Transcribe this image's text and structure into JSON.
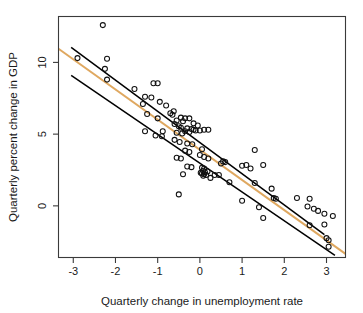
{
  "chart_data": {
    "type": "scatter",
    "title": "",
    "xlabel": "Quarterly change in unemployment rate",
    "ylabel": "Quarterly percent change in GDP",
    "xlim": [
      -3.35,
      3.45
    ],
    "ylim": [
      -3.6,
      13.2
    ],
    "xticks": [
      -3,
      -2,
      -1,
      0,
      1,
      2,
      3
    ],
    "xtick_labels": [
      "-3",
      "-2",
      "-1",
      "0",
      "1",
      "2",
      "3"
    ],
    "yticks": [
      0,
      5,
      10
    ],
    "ytick_labels": [
      "0",
      "5",
      "10"
    ],
    "grid": false,
    "legend": "none",
    "marker": "open-circle",
    "marker_color": "#111111",
    "fit_line": {
      "name": "regression line",
      "color": "#DFA860",
      "x": [
        -3.35,
        3.45
      ],
      "y": [
        10.95,
        -3.35
      ],
      "slope": -2.1,
      "intercept": 3.9
    },
    "band_lines": [
      {
        "name": "upper confidence band",
        "color": "#000000",
        "x": [
          -3.05,
          2.95
        ],
        "y": [
          11.05,
          -2.0
        ]
      },
      {
        "name": "lower confidence band",
        "color": "#000000",
        "x": [
          -3.05,
          3.2
        ],
        "y": [
          9.1,
          -3.45
        ]
      }
    ],
    "points": [
      [
        -2.3,
        12.6
      ],
      [
        -2.9,
        10.3
      ],
      [
        -2.2,
        10.25
      ],
      [
        -2.25,
        9.55
      ],
      [
        -2.2,
        8.8
      ],
      [
        -1.55,
        8.15
      ],
      [
        -1.1,
        8.55
      ],
      [
        -1.0,
        8.55
      ],
      [
        -1.3,
        7.6
      ],
      [
        -1.15,
        7.55
      ],
      [
        -1.35,
        7.1
      ],
      [
        -0.95,
        7.25
      ],
      [
        -0.8,
        7.0
      ],
      [
        -0.7,
        6.45
      ],
      [
        -1.25,
        6.4
      ],
      [
        -1.0,
        6.1
      ],
      [
        -0.65,
        6.35
      ],
      [
        -0.45,
        6.15
      ],
      [
        -0.35,
        6.1
      ],
      [
        -0.25,
        6.1
      ],
      [
        -0.55,
        5.95
      ],
      [
        -0.4,
        5.9
      ],
      [
        -0.6,
        5.7
      ],
      [
        -0.5,
        5.55
      ],
      [
        -0.45,
        5.45
      ],
      [
        -0.3,
        5.4
      ],
      [
        -0.2,
        5.35
      ],
      [
        -0.15,
        5.3
      ],
      [
        -0.1,
        5.25
      ],
      [
        0.0,
        5.25
      ],
      [
        0.1,
        5.3
      ],
      [
        -0.35,
        5.2
      ],
      [
        -0.25,
        5.15
      ],
      [
        -0.42,
        5.05
      ],
      [
        -0.55,
        5.1
      ],
      [
        -1.3,
        5.2
      ],
      [
        -1.05,
        4.9
      ],
      [
        -0.9,
        4.85
      ],
      [
        -0.6,
        4.6
      ],
      [
        -0.48,
        4.45
      ],
      [
        -0.3,
        4.35
      ],
      [
        -0.18,
        4.3
      ],
      [
        0.05,
        3.95
      ],
      [
        -0.35,
        3.85
      ],
      [
        -0.25,
        3.75
      ],
      [
        -0.55,
        3.35
      ],
      [
        -0.45,
        3.3
      ],
      [
        0.0,
        3.55
      ],
      [
        0.1,
        3.4
      ],
      [
        0.2,
        3.3
      ],
      [
        0.55,
        3.1
      ],
      [
        0.5,
        2.95
      ],
      [
        -0.3,
        2.75
      ],
      [
        -0.2,
        2.7
      ],
      [
        0.05,
        2.65
      ],
      [
        0.1,
        2.6
      ],
      [
        0.08,
        2.45
      ],
      [
        0.12,
        2.35
      ],
      [
        0.05,
        2.25
      ],
      [
        0.1,
        2.2
      ],
      [
        0.15,
        2.15
      ],
      [
        0.08,
        2.1
      ],
      [
        0.18,
        2.4
      ],
      [
        0.02,
        2.3
      ],
      [
        -0.4,
        2.2
      ],
      [
        0.35,
        2.15
      ],
      [
        0.25,
        1.95
      ],
      [
        -0.5,
        0.8
      ],
      [
        1.0,
        2.8
      ],
      [
        1.3,
        3.9
      ],
      [
        1.1,
        2.85
      ],
      [
        1.2,
        2.6
      ],
      [
        1.5,
        2.85
      ],
      [
        1.3,
        1.6
      ],
      [
        1.0,
        0.35
      ],
      [
        1.7,
        1.2
      ],
      [
        1.75,
        0.55
      ],
      [
        1.8,
        0.5
      ],
      [
        1.4,
        -0.1
      ],
      [
        1.5,
        -0.85
      ],
      [
        2.3,
        0.55
      ],
      [
        2.6,
        0.5
      ],
      [
        2.55,
        -0.05
      ],
      [
        2.6,
        -1.35
      ],
      [
        2.7,
        -0.2
      ],
      [
        2.8,
        -0.35
      ],
      [
        2.95,
        -1.3
      ],
      [
        3.0,
        -2.25
      ],
      [
        3.05,
        -2.4
      ],
      [
        3.05,
        -2.85
      ],
      [
        3.15,
        -0.7
      ],
      [
        2.95,
        -0.55
      ],
      [
        0.6,
        3.05
      ],
      [
        -0.05,
        5.6
      ],
      [
        -0.15,
        5.75
      ],
      [
        0.2,
        5.3
      ],
      [
        -0.62,
        6.6
      ],
      [
        -0.88,
        5.2
      ],
      [
        0.45,
        2.15
      ],
      [
        0.7,
        1.65
      ]
    ]
  }
}
